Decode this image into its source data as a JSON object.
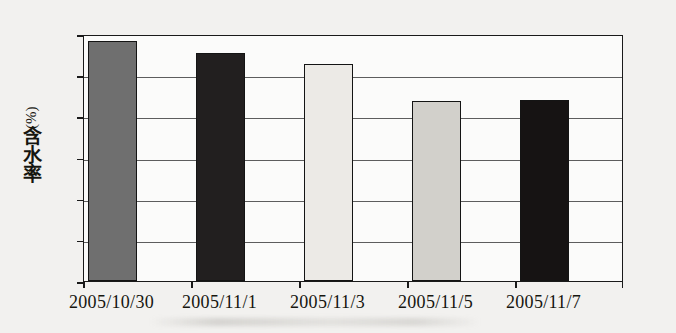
{
  "chart_data": {
    "type": "bar",
    "title": "",
    "xlabel": "",
    "ylabel": "含水率 (%)",
    "ylabel_cjk": "含水率",
    "ylabel_unit": "(%)",
    "categories": [
      "2005/10/30",
      "2005/11/1",
      "2005/11/3",
      "2005/11/5",
      "2005/11/7"
    ],
    "values": [
      29.1,
      27.7,
      26.3,
      21.9,
      22.0
    ],
    "ylim": [
      0,
      30
    ],
    "yticks": [
      0,
      5,
      10,
      15,
      20,
      25,
      30
    ],
    "ytick_labels": [
      "0",
      "5",
      "10",
      "15",
      "20",
      "25",
      "30"
    ],
    "grid": true,
    "grid_axis": "y",
    "legend": false,
    "legend_position": "none",
    "bar_colors": [
      "#6f6f6f",
      "#221f1f",
      "#eceae6",
      "#d2d0cb",
      "#161313"
    ],
    "bar_edge_color": "#141414",
    "axis_color": "#1a1a1a",
    "grid_color": "#5d5d5d",
    "plot_background": "#fbfbfa",
    "page_background": "#f2f1ef"
  }
}
